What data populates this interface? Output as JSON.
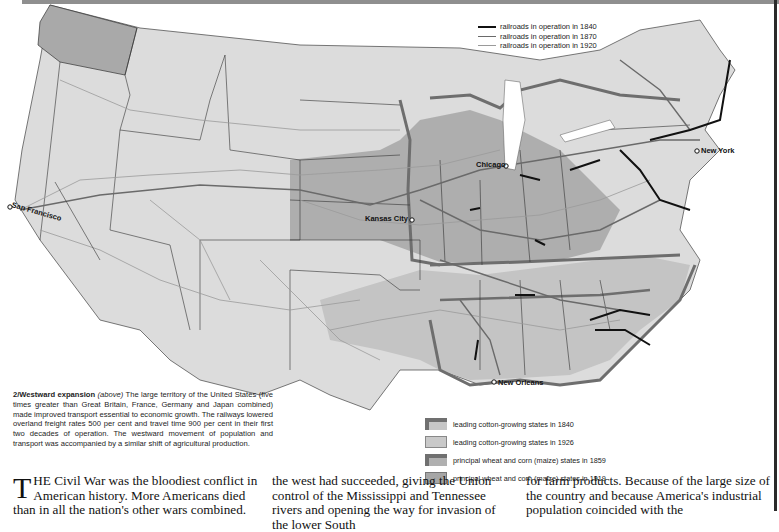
{
  "map": {
    "title": "2/Westward expansion",
    "railroad_legend": [
      {
        "label": "railroads in operation in 1840",
        "color": "#111111",
        "width": 2.2
      },
      {
        "label": "railroads in operation in 1870",
        "color": "#6a6a6a",
        "width": 1.4
      },
      {
        "label": "railroads in operation in 1920",
        "color": "#9a9a9a",
        "width": 0.8
      }
    ],
    "state_legend": [
      {
        "label": "leading cotton-growing states in 1840",
        "style": "a"
      },
      {
        "label": "leading cotton-growing states in 1926",
        "style": "b"
      },
      {
        "label": "principal wheat and corn (maize) states in 1859",
        "style": "c"
      },
      {
        "label": "principal wheat and corn (maize) states in 1919",
        "style": "d"
      }
    ],
    "cities": [
      {
        "name": "San Francisco",
        "x": 12,
        "y": 205
      },
      {
        "name": "Kansas City",
        "x": 365,
        "y": 215
      },
      {
        "name": "Chicago",
        "x": 478,
        "y": 163
      },
      {
        "name": "New York",
        "x": 700,
        "y": 148
      },
      {
        "name": "New Orleans",
        "x": 496,
        "y": 379
      }
    ],
    "colors": {
      "land": "#d9d9d9",
      "wheat_1919": "#a8a8a8",
      "cotton_1926": "#c4c4c4",
      "border_emphasis": "#6e6e6e",
      "water": "#ffffff"
    }
  },
  "caption": {
    "heading": "2/Westward expansion",
    "aside": "(above)",
    "body": "The large territory of the United States (five times greater than Great Britain, France, Germany and Japan combined) made improved transport essential to economic growth. The railways lowered overland freight rates 500 per cent and travel time 900 per cent in their first two decades of operation. The westward movement of population and transport was accompanied by a similar shift of agricultural production."
  },
  "article": {
    "col1_dropcap": "T",
    "col1": "HE Civil War was the bloodiest conflict in American history. More Americans died than in all the nation's other wars combined.",
    "col2": "the west had succeeded, giving the Union control of the Mississippi and Tennessee rivers and opening the way for invasion of the lower South",
    "col3": "for farm products. Because of the large size of the country and because America's industrial population coincided with the"
  }
}
